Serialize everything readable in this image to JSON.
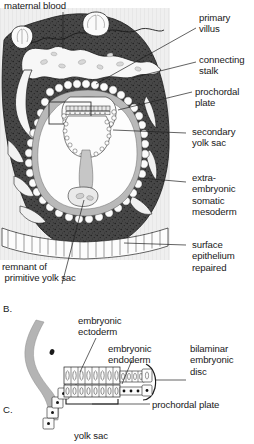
{
  "figure": {
    "title_implied": "Implantation and bilaminar embryonic disc",
    "background_hex": "#ffffff",
    "panel_a": {
      "id": "",
      "labels": {
        "maternal_blood": "maternal blood",
        "primary_villus": "primary\nvillus",
        "connecting_stalk": "connecting\nstalk",
        "prochordal_plate": "prochordal\nplate",
        "secondary_yolk_sac": "secondary\nyolk sac",
        "extraembryonic_somatic_mesoderm": "extra-\nembryonic\nsomatic\nmesoderm",
        "surface_epithelium_repaired": "surface\nepithelium\nrepaired",
        "remnant_primitive_yolk_sac": "remnant of\n primitive yolk sac"
      }
    },
    "panel_b": {
      "id": "B."
    },
    "panel_c": {
      "id": "C.",
      "labels": {
        "embryonic_ectoderm": "embryonic\nectoderm",
        "embryonic_endoderm": "embryonic\nendoderm",
        "bilaminar_embryonic_disc": "bilaminar\nembryonic\ndisc",
        "prochordal_plate": "prochordal plate",
        "yolk_sac": "yolk sac"
      }
    },
    "colors": {
      "decidua_dark": "#3a3a3a",
      "lacuna_white": "#f6f6f6",
      "mesoderm_grey": "#b9b9b9",
      "cavity_white": "#fdfdfd",
      "epithelium_outline": "#2a2a2a",
      "leader_line": "#202020",
      "text": "#191919"
    }
  }
}
